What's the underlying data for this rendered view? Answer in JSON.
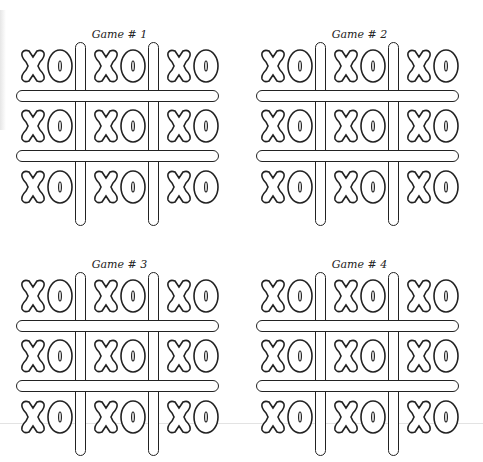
{
  "worksheet": {
    "games": [
      {
        "title": "Game # 1",
        "cells": [
          "XO",
          "XO",
          "XO",
          "XO",
          "XO",
          "XO",
          "XO",
          "XO",
          "XO"
        ]
      },
      {
        "title": "Game # 2",
        "cells": [
          "XO",
          "XO",
          "XO",
          "XO",
          "XO",
          "XO",
          "XO",
          "XO",
          "XO"
        ]
      },
      {
        "title": "Game # 3",
        "cells": [
          "XO",
          "XO",
          "XO",
          "XO",
          "XO",
          "XO",
          "XO",
          "XO",
          "XO"
        ]
      },
      {
        "title": "Game # 4",
        "cells": [
          "XO",
          "XO",
          "XO",
          "XO",
          "XO",
          "XO",
          "XO",
          "XO",
          "XO"
        ]
      }
    ],
    "colors": {
      "ink": "#222222",
      "paper": "#ffffff"
    }
  }
}
